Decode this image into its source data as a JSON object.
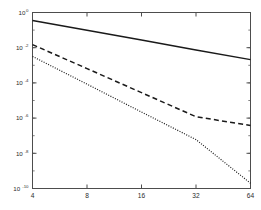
{
  "chart_data": {
    "type": "line",
    "title": "",
    "subtitle": "",
    "xlabel": "",
    "ylabel": "",
    "xscale": "log2",
    "yscale": "log10",
    "grid": false,
    "legend": null,
    "legend_position": "none",
    "xlim": [
      4,
      64
    ],
    "ylim": [
      1e-10,
      1
    ],
    "xticks": [
      4,
      8,
      16,
      32,
      64
    ],
    "xtick_labels": [
      "4",
      "8",
      "16",
      "32",
      "64"
    ],
    "yticks": [
      1,
      0.01,
      0.0001,
      1e-06,
      1e-08,
      1e-10
    ],
    "ytick_labels": [
      {
        "mantissa": "10",
        "exponent": "0"
      },
      {
        "mantissa": "10",
        "exponent": "-2"
      },
      {
        "mantissa": "10",
        "exponent": "-4"
      },
      {
        "mantissa": "10",
        "exponent": "-6"
      },
      {
        "mantissa": "10",
        "exponent": "-8"
      },
      {
        "mantissa": "10",
        "exponent": "-10"
      }
    ],
    "series": [
      {
        "name": "solid",
        "style": "solid",
        "color": "#1a1a1a",
        "width": 1.5,
        "x": [
          4,
          8,
          16,
          32,
          64
        ],
        "y": [
          0.35,
          0.097,
          0.027,
          0.0075,
          0.0021
        ]
      },
      {
        "name": "dashed",
        "style": "dashed",
        "color": "#1a1a1a",
        "width": 1.5,
        "x": [
          4,
          8,
          16,
          32,
          64
        ],
        "y": [
          0.015,
          0.00065,
          2.8e-05,
          1.2e-06,
          3.8e-07
        ]
      },
      {
        "name": "dotted",
        "style": "dotted",
        "color": "#1a1a1a",
        "width": 1.2,
        "x": [
          4,
          8,
          16,
          32,
          64
        ],
        "y": [
          0.0032,
          8.5e-05,
          2.2e-06,
          6e-08,
          2e-10
        ]
      }
    ]
  },
  "axes": {
    "frame_color": "#4d4d4d",
    "background": "#ffffff"
  }
}
